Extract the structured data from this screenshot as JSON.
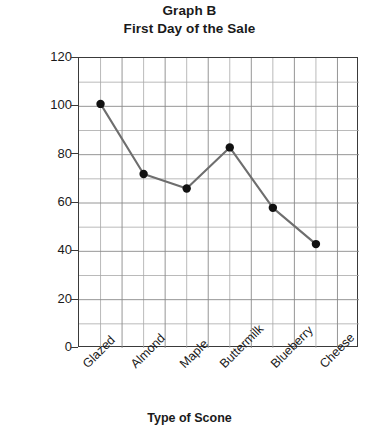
{
  "chart_data": {
    "type": "line",
    "title": "Graph B",
    "subtitle": "First Day of the Sale",
    "xlabel": "Type of Scone",
    "ylabel": "Number of Scones",
    "categories": [
      "Glazed",
      "Almond",
      "Maple",
      "Buttermilk",
      "Blueberry",
      "Cheese"
    ],
    "values": [
      101,
      72,
      66,
      83,
      58,
      43
    ],
    "series": [
      {
        "name": "Number of Scones",
        "values": [
          101,
          72,
          66,
          83,
          58,
          43
        ]
      }
    ],
    "ylim": [
      0,
      120
    ],
    "ytick_labels": [
      "0",
      "20",
      "40",
      "60",
      "80",
      "100",
      "120"
    ],
    "ytick_values": [
      0,
      20,
      40,
      60,
      80,
      100,
      120
    ],
    "y_major_step": 20,
    "y_minor_step": 10,
    "grid": "on",
    "legend": "none",
    "marker": "filled-circle",
    "line_color": "#6e6e6e",
    "marker_color": "#111111",
    "grid_color": "#9a9a9a",
    "axis_color": "#3a3a3a",
    "background": "#ffffff"
  }
}
